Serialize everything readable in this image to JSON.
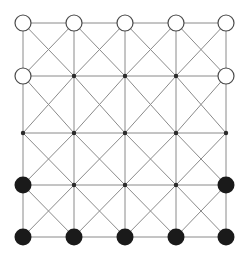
{
  "figure": {
    "width": 248,
    "height": 257,
    "background_color": "#ffffff"
  },
  "style": {
    "edge_color": "#8a8a8a",
    "edge_width": 1,
    "open_node_stroke": "#4a4a4a",
    "open_node_fill": "#ffffff",
    "open_node_stroke_width": 1.2,
    "filled_node_color": "#1a1a1a",
    "dot_node_color": "#2b2b2b",
    "open_node_radius": 8,
    "filled_node_radius": 8.5,
    "dot_node_radius": 2.2
  },
  "chart_data": {
    "type": "diagram",
    "grid": {
      "columns": 5,
      "rows": 5,
      "column_x": [
        23,
        74,
        125,
        176,
        226
      ],
      "row_y": [
        23,
        76,
        133,
        185,
        237
      ],
      "cell_width": 51,
      "cell_height": 53
    },
    "edges": {
      "horizontal": true,
      "vertical": true,
      "diagonal_down_right": true,
      "diagonal_down_left": true
    },
    "node_types": {
      "open": "open-circle",
      "filled": "filled-circle",
      "dot": "small-dot"
    },
    "nodes": [
      [
        {
          "col": 0,
          "row": 0,
          "type": "open"
        },
        {
          "col": 1,
          "row": 0,
          "type": "open"
        },
        {
          "col": 2,
          "row": 0,
          "type": "open"
        },
        {
          "col": 3,
          "row": 0,
          "type": "open"
        },
        {
          "col": 4,
          "row": 0,
          "type": "open"
        }
      ],
      [
        {
          "col": 0,
          "row": 1,
          "type": "open"
        },
        {
          "col": 1,
          "row": 1,
          "type": "dot"
        },
        {
          "col": 2,
          "row": 1,
          "type": "dot"
        },
        {
          "col": 3,
          "row": 1,
          "type": "dot"
        },
        {
          "col": 4,
          "row": 1,
          "type": "open"
        }
      ],
      [
        {
          "col": 0,
          "row": 2,
          "type": "dot"
        },
        {
          "col": 1,
          "row": 2,
          "type": "dot"
        },
        {
          "col": 2,
          "row": 2,
          "type": "dot"
        },
        {
          "col": 3,
          "row": 2,
          "type": "dot"
        },
        {
          "col": 4,
          "row": 2,
          "type": "dot"
        }
      ],
      [
        {
          "col": 0,
          "row": 3,
          "type": "filled"
        },
        {
          "col": 1,
          "row": 3,
          "type": "dot"
        },
        {
          "col": 2,
          "row": 3,
          "type": "dot"
        },
        {
          "col": 3,
          "row": 3,
          "type": "dot"
        },
        {
          "col": 4,
          "row": 3,
          "type": "filled"
        }
      ],
      [
        {
          "col": 0,
          "row": 4,
          "type": "filled"
        },
        {
          "col": 1,
          "row": 4,
          "type": "filled"
        },
        {
          "col": 2,
          "row": 4,
          "type": "filled"
        },
        {
          "col": 3,
          "row": 4,
          "type": "filled"
        },
        {
          "col": 4,
          "row": 4,
          "type": "filled"
        }
      ]
    ],
    "cell_centers": [
      {
        "cx": 48.5,
        "cy": 49.5
      },
      {
        "cx": 99.5,
        "cy": 49.5
      },
      {
        "cx": 150.5,
        "cy": 49.5
      },
      {
        "cx": 201.0,
        "cy": 49.5
      },
      {
        "cx": 48.5,
        "cy": 104.5
      },
      {
        "cx": 99.5,
        "cy": 104.5
      },
      {
        "cx": 150.5,
        "cy": 104.5
      },
      {
        "cx": 201.0,
        "cy": 104.5
      },
      {
        "cx": 48.5,
        "cy": 159.0
      },
      {
        "cx": 99.5,
        "cy": 159.0
      },
      {
        "cx": 150.5,
        "cy": 159.0
      },
      {
        "cx": 201.0,
        "cy": 159.0
      },
      {
        "cx": 48.5,
        "cy": 211.0
      },
      {
        "cx": 99.5,
        "cy": 211.0
      },
      {
        "cx": 150.5,
        "cy": 211.0
      },
      {
        "cx": 201.0,
        "cy": 211.0
      }
    ],
    "counts": {
      "total_nodes": 25,
      "open_nodes": 7,
      "filled_nodes": 7,
      "dot_nodes": 11
    }
  }
}
